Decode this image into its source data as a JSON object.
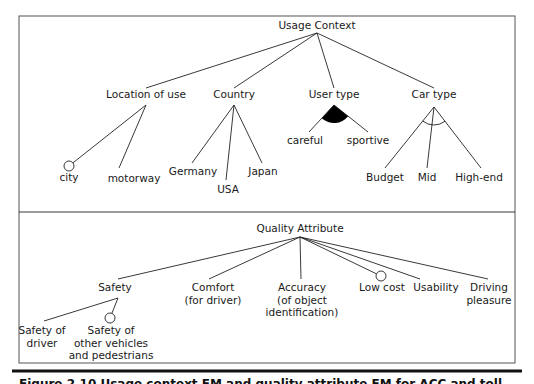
{
  "figure": {
    "frame": {
      "x": 19,
      "y": 16,
      "w": 496,
      "h": 347,
      "divider_y": 212,
      "stroke": "#555555"
    },
    "bottom_rule": {
      "y": 371,
      "x1": 12,
      "x2": 522,
      "thickness": 3,
      "color": "#111111"
    },
    "caption": "Figure 2.10  Usage context FM and quality attribute FM for ACC and toll..."
  },
  "usage_context": {
    "root": {
      "label": "Usage Context",
      "x": 317,
      "y": 29,
      "anchor_y": 33
    },
    "groups": [
      {
        "label": "Location of use",
        "x": 146,
        "y": 98,
        "top_y": 88,
        "bottom_y": 105,
        "variability": "none",
        "children": [
          {
            "label": "city",
            "x": 69,
            "y": 181,
            "line_end": [
              73,
              167
            ],
            "optional": true,
            "circle": [
              69,
              166
            ]
          },
          {
            "label": "motorway",
            "x": 134,
            "y": 182,
            "line_end": [
              119,
              168
            ],
            "optional": false
          }
        ]
      },
      {
        "label": "Country",
        "x": 234,
        "y": 98,
        "top_y": 88,
        "bottom_y": 105,
        "variability": "none",
        "children": [
          {
            "label": "Germany",
            "x": 193,
            "y": 175,
            "line_end": [
              192,
              163
            ],
            "optional": false
          },
          {
            "label": "USA",
            "x": 228,
            "y": 193,
            "line_end": [
              226,
              180
            ],
            "optional": false
          },
          {
            "label": "Japan",
            "x": 263,
            "y": 175,
            "line_end": [
              262,
              163
            ],
            "optional": false
          }
        ]
      },
      {
        "label": "User type",
        "x": 334,
        "y": 98,
        "top_y": 88,
        "bottom_y": 105,
        "variability": "or",
        "children": [
          {
            "label": "careful",
            "x": 305,
            "y": 144,
            "line_end": [
              309,
              132
            ],
            "optional": false
          },
          {
            "label": "sportive",
            "x": 368,
            "y": 144,
            "line_end": [
              368,
              132
            ],
            "optional": false
          }
        ]
      },
      {
        "label": "Car type",
        "x": 434,
        "y": 98,
        "top_y": 88,
        "bottom_y": 107,
        "variability": "alternative",
        "children": [
          {
            "label": "Budget",
            "x": 385,
            "y": 181,
            "line_end": [
              385,
              168
            ],
            "optional": false
          },
          {
            "label": "Mid",
            "x": 427,
            "y": 181,
            "line_end": [
              427,
              168
            ],
            "optional": false
          },
          {
            "label": "High-end",
            "x": 479,
            "y": 181,
            "line_end": [
              481,
              168
            ],
            "optional": false
          }
        ]
      }
    ]
  },
  "quality_attribute": {
    "root": {
      "label": "Quality Attribute",
      "x": 300,
      "y": 232,
      "anchor_y": 237
    },
    "children": [
      {
        "label_lines": [
          "Safety"
        ],
        "x": 115,
        "y": 291,
        "top": [
          118,
          279
        ],
        "optional": false,
        "children": [
          {
            "label_lines": [
              "Safety of",
              "driver"
            ],
            "x": 42,
            "y": 334,
            "line_end": [
              44,
              321
            ],
            "optional": false
          },
          {
            "label_lines": [
              "Safety of",
              "other vehicles",
              "and pedestrians"
            ],
            "x": 111,
            "y": 334,
            "line_end": [
              111,
              317
            ],
            "optional": true,
            "circle": [
              110,
              318
            ]
          }
        ]
      },
      {
        "label_lines": [
          "Comfort",
          "(for driver)"
        ],
        "x": 213,
        "y": 291,
        "top": [
          209,
          279
        ],
        "optional": false
      },
      {
        "label_lines": [
          "Accuracy",
          "(of object",
          "identification)"
        ],
        "x": 302,
        "y": 291,
        "top": [
          301,
          279
        ],
        "optional": false
      },
      {
        "label_lines": [
          "Low cost"
        ],
        "x": 382,
        "y": 291,
        "top": [
          376,
          271
        ],
        "optional": true,
        "circle": [
          381,
          276
        ]
      },
      {
        "label_lines": [
          "Usability"
        ],
        "x": 436,
        "y": 291,
        "top": [
          420,
          279
        ],
        "optional": false
      },
      {
        "label_lines": [
          "Driving",
          "pleasure"
        ],
        "x": 489,
        "y": 291,
        "top": [
          488,
          279
        ],
        "optional": false
      }
    ]
  }
}
